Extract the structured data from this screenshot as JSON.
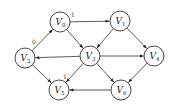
{
  "diagram": {
    "type": "directed-graph",
    "node_radius": 10,
    "nodes": [
      {
        "id": "V0",
        "label": "V",
        "sub": "0",
        "x": 60,
        "y": 22
      },
      {
        "id": "V1",
        "label": "V",
        "sub": "1",
        "x": 120,
        "y": 21
      },
      {
        "id": "V2",
        "label": "V",
        "sub": "2",
        "x": 25,
        "y": 58
      },
      {
        "id": "V3",
        "label": "V",
        "sub": "3",
        "x": 90,
        "y": 56
      },
      {
        "id": "V4",
        "label": "V",
        "sub": "4",
        "x": 154,
        "y": 56
      },
      {
        "id": "V5",
        "label": "V",
        "sub": "5",
        "x": 59,
        "y": 90
      },
      {
        "id": "V6",
        "label": "V",
        "sub": "6",
        "x": 121,
        "y": 90
      }
    ],
    "edges": [
      {
        "from": "V0",
        "to": "V1",
        "weight": "1",
        "lx": 71,
        "ly": 17
      },
      {
        "from": "V2",
        "to": "V0",
        "weight": "0",
        "lx": 32,
        "ly": 44
      },
      {
        "from": "V0",
        "to": "V3",
        "weight": ""
      },
      {
        "from": "V1",
        "to": "V3",
        "weight": ""
      },
      {
        "from": "V1",
        "to": "V4",
        "weight": ""
      },
      {
        "from": "V3",
        "to": "V2",
        "weight": ""
      },
      {
        "from": "V3",
        "to": "V4",
        "weight": ""
      },
      {
        "from": "V3",
        "to": "V5",
        "weight": "1",
        "lx": 63,
        "ly": 79
      },
      {
        "from": "V3",
        "to": "V6",
        "weight": ""
      },
      {
        "from": "V2",
        "to": "V5",
        "weight": ""
      },
      {
        "from": "V4",
        "to": "V6",
        "weight": ""
      },
      {
        "from": "V6",
        "to": "V5",
        "weight": ""
      }
    ]
  }
}
